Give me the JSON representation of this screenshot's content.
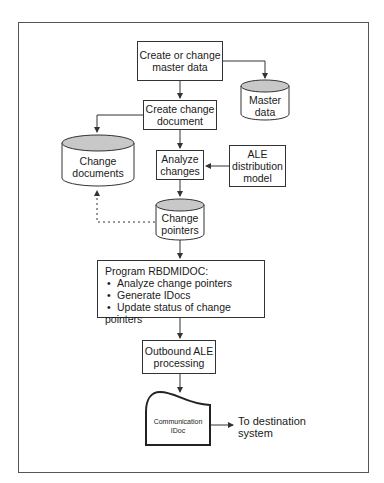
{
  "diagram": {
    "nodes": {
      "create_master": {
        "line1": "Create or change",
        "line2": "master data"
      },
      "master_data": {
        "line1": "Master",
        "line2": "data"
      },
      "create_change_doc": {
        "line1": "Create change",
        "line2": "document"
      },
      "change_documents": {
        "line1": "Change",
        "line2": "documents"
      },
      "analyze_changes": {
        "line1": "Analyze",
        "line2": "changes"
      },
      "ale_model": {
        "line1": "ALE",
        "line2": "distribution",
        "line3": "model"
      },
      "change_pointers": {
        "line1": "Change",
        "line2": "pointers"
      },
      "program": {
        "title": "Program RBDMIDOC:",
        "bullets": [
          "Analyze change pointers",
          "Generate IDocs",
          "Update status of change pointers"
        ]
      },
      "outbound": {
        "line1": "Outbound ALE",
        "line2": "processing"
      },
      "idoc": {
        "line1": "Communication",
        "line2": "IDoc"
      },
      "destination": {
        "line1": "To destination",
        "line2": "system"
      }
    },
    "colors": {
      "line": "#333333",
      "cylinder_top": "#c8c8c8",
      "frame": "#555555"
    }
  }
}
